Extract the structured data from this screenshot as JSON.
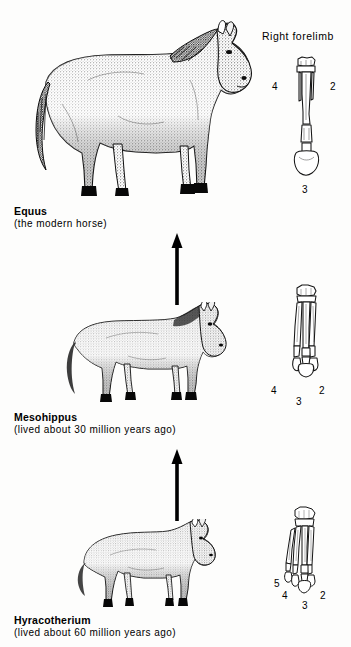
{
  "figure": {
    "background_color": "#fdfdfc",
    "ink_color": "#000000"
  },
  "panel_header": {
    "label": "Right forelimb"
  },
  "stages": [
    {
      "id": "equus",
      "name": "Equus",
      "subtitle": "(the modern horse)",
      "animal_icon": "horse-equus-illustration",
      "limb_icon": "forelimb-bones-equus",
      "digits": [
        {
          "value": "4",
          "position": "left"
        },
        {
          "value": "2",
          "position": "right"
        },
        {
          "value": "3",
          "position": "below"
        }
      ]
    },
    {
      "id": "mesohippus",
      "name": "Mesohippus",
      "subtitle": "(lived about 30 million years ago)",
      "animal_icon": "horse-mesohippus-illustration",
      "limb_icon": "forelimb-bones-mesohippus",
      "digits": [
        {
          "value": "4",
          "position": "left"
        },
        {
          "value": "2",
          "position": "right"
        },
        {
          "value": "3",
          "position": "below"
        }
      ]
    },
    {
      "id": "hyracotherium",
      "name": "Hyracotherium",
      "subtitle": "(lived about 60 million years ago)",
      "animal_icon": "horse-hyracotherium-illustration",
      "limb_icon": "forelimb-bones-hyracotherium",
      "digits": [
        {
          "value": "5",
          "position": "far-left"
        },
        {
          "value": "4",
          "position": "left"
        },
        {
          "value": "2",
          "position": "right"
        },
        {
          "value": "3",
          "position": "below"
        }
      ]
    }
  ],
  "arrows": [
    {
      "id": "arrow-mesohippus-to-equus",
      "direction": "up"
    },
    {
      "id": "arrow-hyracotherium-to-mesohippus",
      "direction": "up"
    }
  ]
}
